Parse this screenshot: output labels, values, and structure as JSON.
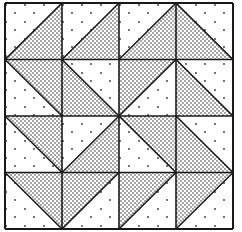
{
  "quilt": {
    "rows": 4,
    "cols": 4,
    "origin": [
      5,
      3
    ],
    "cell_width": 57,
    "cell_height": 56.5,
    "colors": {
      "background": "#ffffff",
      "line": "#1a1a1a",
      "dot": "#222222"
    },
    "cells": [
      [
        {
          "diag": "/",
          "shaded": "BR"
        },
        {
          "diag": "/",
          "shaded": "BR"
        },
        {
          "diag": "/",
          "shaded": "BR"
        },
        {
          "diag": "\\",
          "shaded": "BL"
        }
      ],
      [
        {
          "diag": "\\",
          "shaded": "TR"
        },
        {
          "diag": "\\",
          "shaded": "BL"
        },
        {
          "diag": "/",
          "shaded": "TL"
        },
        {
          "diag": "\\",
          "shaded": "BL"
        }
      ],
      [
        {
          "diag": "\\",
          "shaded": "TR"
        },
        {
          "diag": "/",
          "shaded": "BR"
        },
        {
          "diag": "\\",
          "shaded": "TR"
        },
        {
          "diag": "\\",
          "shaded": "BL"
        }
      ],
      [
        {
          "diag": "\\",
          "shaded": "TR"
        },
        {
          "diag": "/",
          "shaded": "TL"
        },
        {
          "diag": "/",
          "shaded": "TL"
        },
        {
          "diag": "/",
          "shaded": "TL"
        }
      ]
    ]
  }
}
